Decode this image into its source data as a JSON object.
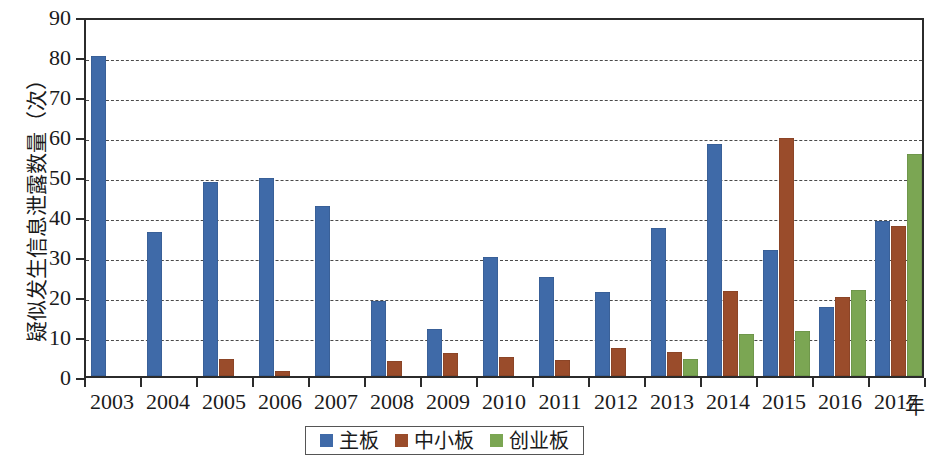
{
  "chart_data": {
    "type": "bar",
    "title": "",
    "xlabel": "年",
    "ylabel": "疑似发生信息泄露数量（次）",
    "ylim": [
      0,
      90
    ],
    "ytick_step": 10,
    "yticks": [
      90,
      80,
      70,
      60,
      50,
      40,
      30,
      20,
      10,
      0
    ],
    "grid": true,
    "grid_style": "dashed-horizontal",
    "legend_position": "bottom-center",
    "categories": [
      "2003",
      "2004",
      "2005",
      "2006",
      "2007",
      "2008",
      "2009",
      "2010",
      "2011",
      "2012",
      "2013",
      "2014",
      "2015",
      "2016",
      "2017"
    ],
    "series": [
      {
        "name": "主板",
        "color": "#3f6aa8",
        "values": [
          80,
          36,
          48.5,
          49.5,
          42.5,
          18.7,
          11.7,
          29.7,
          24.7,
          21,
          37,
          58,
          31.5,
          17.3,
          38.8
        ]
      },
      {
        "name": "中小板",
        "color": "#9a4c2b",
        "values": [
          0,
          0,
          4.2,
          1.3,
          0,
          3.7,
          5.8,
          4.8,
          4,
          7,
          6,
          21.3,
          59.4,
          19.7,
          37.5
        ]
      },
      {
        "name": "创业板",
        "color": "#7ba653",
        "values": [
          0,
          0,
          0,
          0,
          0,
          0,
          0,
          0,
          0,
          0,
          4.2,
          10.5,
          11.3,
          21.5,
          55.5
        ]
      }
    ]
  },
  "legend": {
    "items": [
      {
        "label": "主板",
        "color": "#3f6aa8"
      },
      {
        "label": "中小板",
        "color": "#9a4c2b"
      },
      {
        "label": "创业板",
        "color": "#7ba653"
      }
    ]
  },
  "axes": {
    "y_title": "疑似发生信息泄露数量（次）",
    "x_unit": "年"
  }
}
